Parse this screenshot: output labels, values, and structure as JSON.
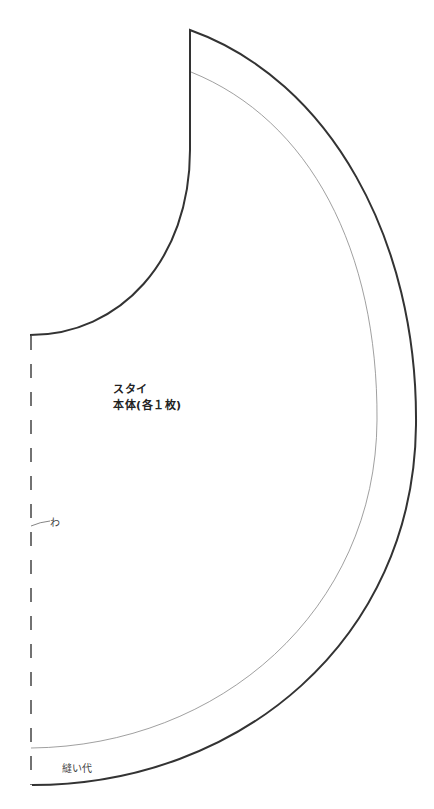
{
  "pattern": {
    "piece_name": "スタイ",
    "piece_detail": "本体(各１枚)",
    "fold_label": "わ",
    "seam_allowance_label": "縫い代",
    "colors": {
      "cut_line": "#333333",
      "seam_line": "#888888",
      "background": "#ffffff"
    }
  }
}
